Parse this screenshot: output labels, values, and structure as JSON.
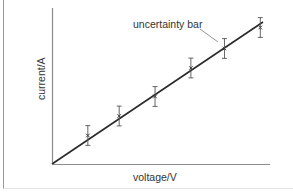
{
  "chart_data": {
    "type": "scatter",
    "title": "",
    "xlabel": "voltage/V",
    "ylabel": "current/A",
    "grid": false,
    "legend": null,
    "ticks": false,
    "annotations": [
      {
        "text": "uncertainty bar",
        "points_to": "error bar of point 5"
      }
    ],
    "fit_line": {
      "type": "linear",
      "through_origin": true,
      "x0": 0,
      "y0": 0,
      "x1": 1.0,
      "y1": 0.94
    },
    "series": [
      {
        "name": "measurements",
        "x": [
          0.16,
          0.3,
          0.46,
          0.62,
          0.77,
          0.93
        ],
        "y": [
          0.19,
          0.32,
          0.45,
          0.64,
          0.77,
          0.91
        ],
        "error": [
          0.06,
          0.06,
          0.06,
          0.06,
          0.06,
          0.06
        ]
      }
    ],
    "xlim": [
      0,
      1.0
    ],
    "ylim": [
      0,
      1.0
    ]
  },
  "labels": {
    "xlabel": "voltage/V",
    "ylabel": "current/A",
    "annotation": "uncertainty bar"
  },
  "colors": {
    "line": "#2a2a2a",
    "axis": "#8c8c8c",
    "error_bar": "#555555",
    "text": "#333333"
  }
}
